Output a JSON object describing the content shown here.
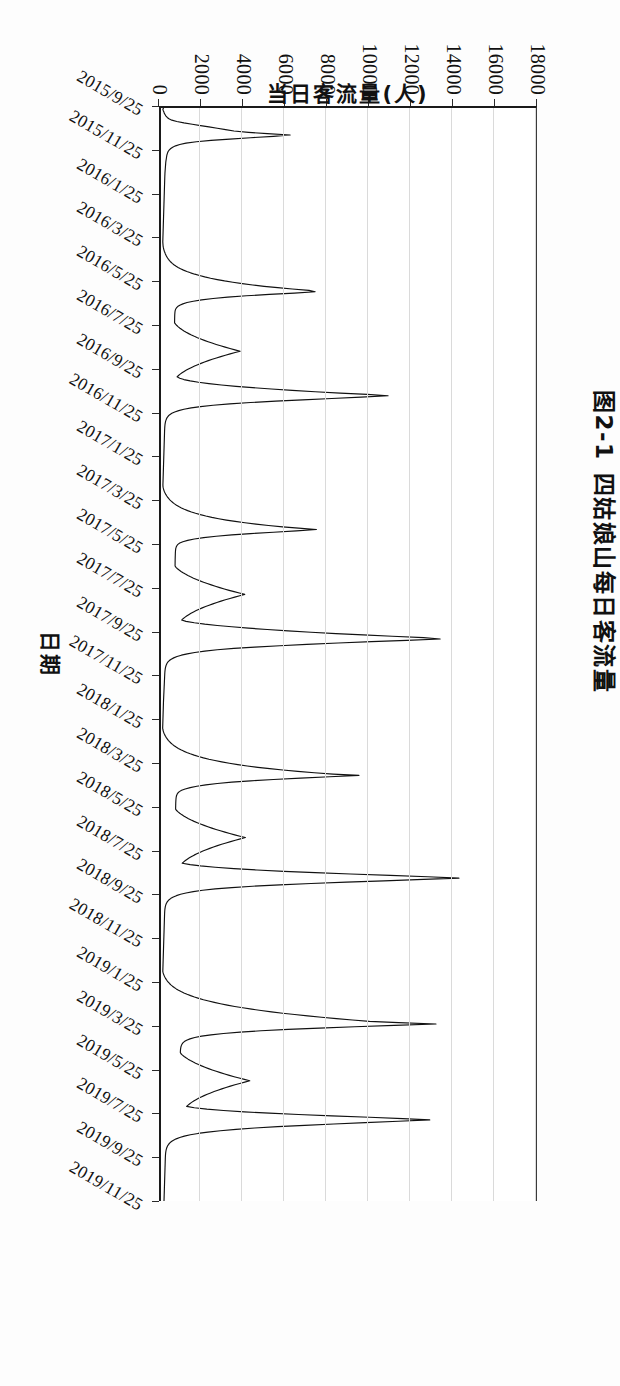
{
  "figure": {
    "number": "图2-1",
    "title": "四姑娘山每日客流量",
    "caption_full": "图2-1  四姑娘山每日客流量"
  },
  "axes": {
    "y_title": "当日客流量(人)",
    "x_title": "日期"
  },
  "chart_data": {
    "type": "line",
    "title": "四姑娘山每日客流量",
    "xlabel": "日期",
    "ylabel": "当日客流量(人)",
    "orientation": "page-rotated-90",
    "grid": true,
    "legend": "none",
    "ylim": [
      0,
      18000
    ],
    "ytick_labels": [
      "0",
      "2000",
      "4000",
      "6000",
      "8000",
      "10000",
      "12000",
      "14000",
      "16000",
      "18000"
    ],
    "ytick_values": [
      0,
      2000,
      4000,
      6000,
      8000,
      10000,
      12000,
      14000,
      16000,
      18000
    ],
    "xtick_labels": [
      "2015/9/25",
      "2015/11/25",
      "2016/1/25",
      "2016/3/25",
      "2016/5/25",
      "2016/7/25",
      "2016/9/25",
      "2016/11/25",
      "2017/1/25",
      "2017/3/25",
      "2017/5/25",
      "2017/7/25",
      "2017/9/25",
      "2017/11/25",
      "2018/1/25",
      "2018/3/25",
      "2018/5/25",
      "2018/7/25",
      "2018/9/25",
      "2018/11/25",
      "2019/1/25",
      "2019/3/25",
      "2019/5/25",
      "2019/7/25",
      "2019/9/25",
      "2019/11/25"
    ],
    "x_range": [
      "2015/9/25",
      "2019/12/31"
    ],
    "series_name": "当日客流量",
    "line_color": "#111111",
    "peak_values": [
      {
        "date": "2018/10/2",
        "value": 14300
      },
      {
        "date": "2017/10/3",
        "value": 13400
      },
      {
        "date": "2019/5/2",
        "value": 13200
      },
      {
        "date": "2019/10/3",
        "value": 12900
      },
      {
        "date": "2016/10/3",
        "value": 10900
      },
      {
        "date": "2018/5/1",
        "value": 9500
      },
      {
        "date": "2016/5/2",
        "value": 7400
      }
    ],
    "values": [
      120,
      90,
      110,
      140,
      160,
      200,
      240,
      300,
      380,
      520,
      760,
      1100,
      1500,
      1900,
      2300,
      2700,
      3100,
      3500,
      4200,
      5100,
      6200,
      5400,
      4300,
      3300,
      2400,
      1700,
      1200,
      900,
      700,
      560,
      470,
      400,
      350,
      320,
      300,
      280,
      270,
      260,
      250,
      240,
      230,
      225,
      220,
      215,
      210,
      205,
      200,
      195,
      190,
      188,
      185,
      182,
      180,
      178,
      176,
      174,
      172,
      170,
      168,
      166,
      164,
      162,
      160,
      158,
      156,
      154,
      152,
      150,
      148,
      146,
      144,
      142,
      140,
      138,
      136,
      134,
      132,
      130,
      128,
      126,
      124,
      122,
      120,
      118,
      116,
      114,
      112,
      110,
      108,
      106,
      104,
      102,
      100,
      98,
      96,
      94,
      92,
      90,
      88,
      86,
      90,
      95,
      100,
      110,
      125,
      140,
      160,
      185,
      210,
      240,
      275,
      315,
      360,
      410,
      470,
      540,
      620,
      710,
      820,
      940,
      1080,
      1240,
      1420,
      1620,
      1850,
      2100,
      2380,
      2700,
      3050,
      3450,
      3900,
      4400,
      4950,
      5600,
      6300,
      7100,
      7400,
      6400,
      5200,
      4100,
      3200,
      2500,
      1950,
      1550,
      1250,
      1050,
      900,
      800,
      740,
      700,
      680,
      670,
      665,
      660,
      658,
      656,
      655,
      654,
      653,
      652,
      700,
      760,
      830,
      910,
      1000,
      1100,
      1210,
      1330,
      1460,
      1600,
      1750,
      1910,
      2080,
      2260,
      2450,
      2650,
      2860,
      3080,
      3310,
      3550,
      3800,
      3560,
      3320,
      3090,
      2870,
      2660,
      2460,
      2270,
      2090,
      1920,
      1760,
      1610,
      1470,
      1340,
      1220,
      1110,
      1010,
      920,
      840,
      770,
      900,
      1100,
      1400,
      1800,
      2300,
      2900,
      3600,
      4400,
      5300,
      6300,
      7400,
      8600,
      9900,
      10900,
      9600,
      8200,
      6800,
      5500,
      4300,
      3300,
      2500,
      1900,
      1450,
      1100,
      850,
      660,
      520,
      420,
      350,
      300,
      265,
      240,
      220,
      205,
      195,
      188,
      182,
      178,
      175,
      172,
      170,
      168,
      166,
      164,
      162,
      160,
      158,
      156,
      154,
      152,
      150,
      148,
      146,
      144,
      142,
      140,
      138,
      136,
      134,
      132,
      130,
      128,
      126,
      124,
      122,
      120,
      118,
      116,
      114,
      112,
      110,
      108,
      106,
      104,
      102,
      100,
      98,
      96,
      94,
      92,
      95,
      105,
      120,
      140,
      165,
      195,
      230,
      270,
      315,
      365,
      425,
      490,
      565,
      650,
      745,
      855,
      980,
      1120,
      1280,
      1460,
      1660,
      1890,
      2150,
      2440,
      2770,
      3140,
      3560,
      4030,
      4560,
      5160,
      5840,
      6600,
      7460,
      6500,
      5400,
      4300,
      3400,
      2650,
      2050,
      1600,
      1280,
      1050,
      900,
      810,
      760,
      730,
      710,
      700,
      695,
      690,
      688,
      686,
      684,
      682,
      680,
      679,
      678,
      677,
      676,
      675,
      720,
      790,
      870,
      960,
      1060,
      1170,
      1290,
      1420,
      1560,
      1710,
      1870,
      2040,
      2220,
      2410,
      2610,
      2820,
      3040,
      3270,
      3510,
      3760,
      4020,
      3780,
      3540,
      3310,
      3090,
      2880,
      2680,
      2490,
      2310,
      2140,
      1980,
      1830,
      1690,
      1560,
      1440,
      1330,
      1230,
      1140,
      1060,
      990,
      1200,
      1600,
      2100,
      2700,
      3400,
      4200,
      5100,
      6100,
      7200,
      8400,
      9700,
      11100,
      12600,
      13400,
      11800,
      10100,
      8500,
      7000,
      5700,
      4500,
      3500,
      2700,
      2100,
      1620,
      1260,
      980,
      770,
      610,
      490,
      400,
      335,
      290,
      258,
      235,
      218,
      205,
      196,
      189,
      184,
      180,
      177,
      174,
      171,
      168,
      165,
      162,
      159,
      156,
      153,
      150,
      147,
      144,
      141,
      138,
      135,
      132,
      129,
      126,
      123,
      120,
      118,
      116,
      114,
      112,
      110,
      108,
      106,
      104,
      102,
      100,
      98,
      96,
      94,
      92,
      90,
      88,
      86,
      84,
      82,
      80,
      90,
      105,
      125,
      150,
      180,
      215,
      255,
      300,
      350,
      408,
      474,
      548,
      632,
      726,
      832,
      952,
      1086,
      1236,
      1404,
      1592,
      1802,
      2036,
      2298,
      2590,
      2916,
      3280,
      3686,
      4140,
      4648,
      5216,
      5852,
      6564,
      7362,
      8256,
      9500,
      8100,
      6700,
      5400,
      4300,
      3400,
      2700,
      2150,
      1720,
      1400,
      1160,
      990,
      880,
      810,
      770,
      745,
      730,
      722,
      716,
      712,
      709,
      707,
      705,
      704,
      703,
      702,
      750,
      820,
      900,
      990,
      1090,
      1200,
      1320,
      1450,
      1590,
      1740,
      1900,
      2070,
      2250,
      2440,
      2640,
      2850,
      3070,
      3300,
      3540,
      3790,
      4050,
      3810,
      3570,
      3340,
      3120,
      2910,
      2710,
      2520,
      2340,
      2170,
      2010,
      1860,
      1720,
      1590,
      1470,
      1360,
      1260,
      1170,
      1090,
      1020,
      1400,
      1900,
      2600,
      3500,
      4600,
      5900,
      7400,
      9100,
      11000,
      12800,
      14300,
      12600,
      10700,
      8900,
      7200,
      5700,
      4400,
      3400,
      2600,
      2000,
      1550,
      1200,
      940,
      740,
      590,
      475,
      390,
      328,
      283,
      250,
      226,
      209,
      197,
      188,
      182,
      177,
      174,
      171,
      169,
      167,
      165,
      163,
      161,
      159,
      157,
      155,
      153,
      151,
      149,
      147,
      145,
      143,
      141,
      139,
      137,
      135,
      133,
      131,
      129,
      127,
      125,
      123,
      121,
      119,
      117,
      115,
      113,
      111,
      109,
      107,
      105,
      103,
      101,
      99,
      97,
      95,
      93,
      91,
      89,
      87,
      100,
      120,
      145,
      175,
      210,
      250,
      296,
      348,
      407,
      474,
      550,
      636,
      733,
      842,
      964,
      1100,
      1252,
      1420,
      1606,
      1812,
      2038,
      2286,
      2558,
      2856,
      3182,
      3538,
      3926,
      4348,
      4806,
      5302,
      5838,
      6416,
      7038,
      7706,
      8422,
      9188,
      10006,
      11400,
      13200,
      11200,
      9300,
      7600,
      6100,
      4800,
      3800,
      3000,
      2400,
      1950,
      1620,
      1390,
      1230,
      1120,
      1050,
      1005,
      975,
      956,
      944,
      936,
      931,
      928,
      960,
      1030,
      1110,
      1200,
      1300,
      1410,
      1530,
      1660,
      1800,
      1950,
      2110,
      2280,
      2460,
      2650,
      2850,
      3060,
      3280,
      3510,
      3750,
      4000,
      4260,
      4020,
      3780,
      3550,
      3330,
      3120,
      2920,
      2730,
      2550,
      2380,
      2220,
      2070,
      1930,
      1800,
      1680,
      1570,
      1470,
      1380,
      1300,
      1230,
      1600,
      2200,
      3000,
      4000,
      5200,
      6600,
      8200,
      10000,
      11600,
      12900,
      11400,
      9800,
      8300,
      6900,
      5600,
      4500,
      3600,
      2850,
      2250,
      1780,
      1410,
      1120,
      900,
      730,
      600,
      500,
      425,
      368,
      325,
      292,
      268,
      250,
      237,
      227,
      220,
      215,
      211,
      208,
      206,
      204,
      202,
      200,
      198,
      196,
      194,
      192,
      190,
      188,
      186,
      184,
      182,
      180,
      178,
      176,
      174,
      172,
      170,
      168,
      166,
      164,
      162,
      160,
      158,
      156,
      154,
      152,
      150,
      148,
      146,
      144
    ]
  },
  "appearance": {
    "background": "#fdfdfd",
    "plot_background": "#ffffff",
    "gridline_color": "#dadada",
    "axis_color": "#1a1a1a",
    "text_color": "#111111"
  }
}
